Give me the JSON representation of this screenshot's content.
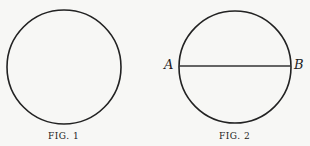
{
  "figures": [
    {
      "caption": "FIG. 1",
      "circle": {
        "cx": 64,
        "cy": 67,
        "r": 57
      }
    },
    {
      "caption": "FIG. 2",
      "circle": {
        "cx": 235,
        "cy": 67,
        "r": 56
      },
      "chord": {
        "label_start": "A",
        "label_end": "B"
      }
    }
  ],
  "colors": {
    "stroke": "#222222",
    "background": "#f7f7f5"
  }
}
